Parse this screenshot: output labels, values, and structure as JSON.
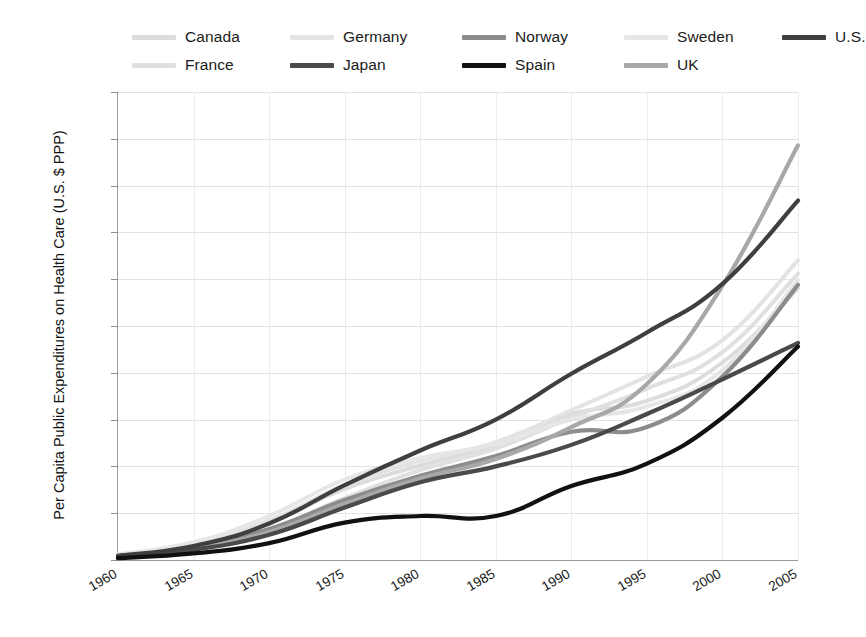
{
  "chart_data": {
    "type": "line",
    "title": "",
    "xlabel": "",
    "ylabel": "Per Capita Public Expenditures on Health Care (U.S. $ PPP)",
    "xlim": [
      1960,
      2005
    ],
    "ylim": [
      0,
      5000
    ],
    "grid": true,
    "legend_position": "top",
    "y_ticks": [
      "0",
      "500",
      "1,000",
      "1,500",
      "2,000",
      "2,500",
      "3,000",
      "3,500",
      "4,000",
      "4,500",
      "5,000"
    ],
    "y_tick_values": [
      0,
      500,
      1000,
      1500,
      2000,
      2500,
      3000,
      3500,
      4000,
      4500,
      5000
    ],
    "x_ticks": [
      "1960",
      "1965",
      "1970",
      "1975",
      "1980",
      "1985",
      "1990",
      "1995",
      "2000",
      "2005"
    ],
    "x_tick_values": [
      1960,
      1965,
      1970,
      1975,
      1980,
      1985,
      1990,
      1995,
      2000,
      2005
    ],
    "x": [
      1960,
      1965,
      1970,
      1975,
      1980,
      1985,
      1990,
      1995,
      2000,
      2005
    ],
    "series": [
      {
        "name": "Canada",
        "color": "#dcdcdc",
        "width": 4.0,
        "values": [
          50,
          160,
          400,
          760,
          1010,
          1230,
          1560,
          1700,
          2110,
          2900
        ]
      },
      {
        "name": "France",
        "color": "#e0e0e0",
        "width": 4.0,
        "values": [
          40,
          150,
          330,
          660,
          960,
          1190,
          1520,
          1830,
          2220,
          3060
        ]
      },
      {
        "name": "Germany",
        "color": "#e3e3e3",
        "width": 4.0,
        "values": [
          55,
          170,
          420,
          800,
          1060,
          1260,
          1600,
          1960,
          2350,
          3200
        ]
      },
      {
        "name": "Japan",
        "color": "#4a4a4a",
        "width": 4.2,
        "values": [
          25,
          110,
          270,
          560,
          830,
          1000,
          1230,
          1560,
          1930,
          2320
        ]
      },
      {
        "name": "Norway",
        "color": "#8c8c8c",
        "width": 4.2,
        "values": [
          40,
          130,
          330,
          640,
          900,
          1110,
          1370,
          1420,
          1960,
          2940
        ]
      },
      {
        "name": "Spain",
        "color": "#111111",
        "width": 4.2,
        "values": [
          20,
          70,
          180,
          400,
          470,
          470,
          790,
          1030,
          1520,
          2280
        ]
      },
      {
        "name": "Sweden",
        "color": "#e6e6e6",
        "width": 4.0,
        "values": [
          60,
          190,
          470,
          860,
          1090,
          1240,
          1500,
          1640,
          2030,
          2990
        ]
      },
      {
        "name": "U.K.",
        "color": "#a8a8a8",
        "width": 4.2,
        "values": [
          35,
          120,
          300,
          600,
          870,
          1080,
          1420,
          1880,
          2930,
          4430
        ]
      },
      {
        "name": "U.S.",
        "color": "#3f3f3f",
        "width": 4.2,
        "values": [
          45,
          150,
          390,
          800,
          1170,
          1500,
          1990,
          2430,
          2950,
          3840
        ]
      }
    ]
  },
  "legend": {
    "rows": [
      [
        {
          "label": "Canada",
          "color": "#dcdcdc",
          "left": 0
        },
        {
          "label": "Germany",
          "color": "#e3e3e3",
          "left": 158
        },
        {
          "label": "Norway",
          "color": "#8c8c8c",
          "left": 330
        },
        {
          "label": "Sweden",
          "color": "#e6e6e6",
          "left": 492
        },
        {
          "label": "U.S.",
          "color": "#3f3f3f",
          "left": 650
        }
      ],
      [
        {
          "label": "France",
          "color": "#e0e0e0",
          "left": 0
        },
        {
          "label": "Japan",
          "color": "#4a4a4a",
          "left": 158
        },
        {
          "label": "Spain",
          "color": "#111111",
          "left": 330
        },
        {
          "label": "UK",
          "color": "#a8a8a8",
          "left": 492
        }
      ]
    ]
  }
}
